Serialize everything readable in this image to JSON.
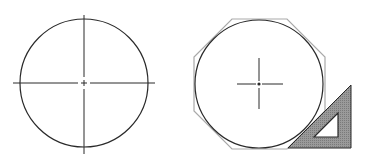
{
  "figure": {
    "colors": {
      "line": "#2a2a2a",
      "construction": "#a9a9a9",
      "tool_fill": "#8c8c8c",
      "background": "#ffffff"
    },
    "panels": [
      {
        "name": "circle-with-center-lines",
        "elements": [
          "circle",
          "horizontal-center-line",
          "vertical-center-line",
          "center-point"
        ]
      },
      {
        "name": "octagon-construction",
        "elements": [
          "circle",
          "circumscribed-octagon",
          "short-center-cross",
          "center-point",
          "set-square-45"
        ]
      }
    ],
    "tool": {
      "icon": "set-square-icon",
      "angle_degrees": 45
    }
  }
}
